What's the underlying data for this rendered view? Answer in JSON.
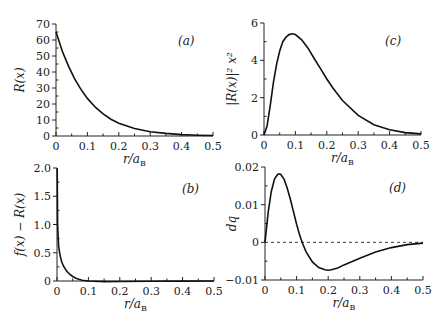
{
  "chart_data": [
    {
      "id": "a",
      "type": "line",
      "panel_label": "(a)",
      "xlabel": "r/a_B",
      "ylabel": "R(x)",
      "xlim": [
        0,
        0.5
      ],
      "ylim": [
        0,
        70
      ],
      "xticks": [
        0,
        0.1,
        0.2,
        0.3,
        0.4,
        0.5
      ],
      "xtick_labels": [
        "0",
        "0.1",
        "0.2",
        "0.3",
        "0.4",
        "0.5"
      ],
      "yticks": [
        0,
        10,
        20,
        30,
        40,
        50,
        60,
        70
      ],
      "ytick_labels": [
        "0",
        "10",
        "20",
        "30",
        "40",
        "50",
        "60",
        "70"
      ],
      "series": [
        {
          "name": "R(x)",
          "x": [
            0,
            0.02,
            0.04,
            0.06,
            0.08,
            0.1,
            0.125,
            0.15,
            0.175,
            0.2,
            0.25,
            0.3,
            0.35,
            0.4,
            0.45,
            0.5
          ],
          "y": [
            65,
            53,
            43.5,
            35.5,
            29,
            23.5,
            18,
            13.8,
            10.5,
            8,
            4.7,
            2.7,
            1.6,
            0.9,
            0.5,
            0.3
          ]
        }
      ]
    },
    {
      "id": "b",
      "type": "line",
      "panel_label": "(b)",
      "xlabel": "r/a_B",
      "ylabel": "f(x) − R(x)",
      "xlim": [
        0,
        0.5
      ],
      "ylim": [
        0,
        2.0
      ],
      "xticks": [
        0,
        0.1,
        0.2,
        0.3,
        0.4,
        0.5
      ],
      "xtick_labels": [
        "0",
        "0.1",
        "0.2",
        "0.3",
        "0.4",
        "0.5"
      ],
      "yticks": [
        0,
        0.5,
        1.0,
        1.5,
        2.0
      ],
      "ytick_labels": [
        "0",
        "0.5",
        "1.0",
        "1.5",
        "2.0"
      ],
      "series": [
        {
          "name": "f(x) − R(x)",
          "x": [
            0.0005,
            0.002,
            0.005,
            0.01,
            0.015,
            0.02,
            0.03,
            0.04,
            0.05,
            0.06,
            0.07,
            0.08,
            0.1,
            0.15,
            0.2,
            0.3,
            0.4,
            0.5
          ],
          "y": [
            2.0,
            1.0,
            0.62,
            0.45,
            0.34,
            0.27,
            0.18,
            0.12,
            0.08,
            0.05,
            0.03,
            0.015,
            0.0,
            -0.01,
            -0.008,
            -0.004,
            -0.002,
            0.0
          ]
        }
      ]
    },
    {
      "id": "c",
      "type": "line",
      "panel_label": "(c)",
      "xlabel": "r/a_B",
      "ylabel": "|R(x)|² x²",
      "xlim": [
        0,
        0.5
      ],
      "ylim": [
        0,
        6
      ],
      "xticks": [
        0,
        0.1,
        0.2,
        0.3,
        0.4,
        0.5
      ],
      "xtick_labels": [
        "0",
        "0.1",
        "0.2",
        "0.3",
        "0.4",
        "0.5"
      ],
      "yticks": [
        0,
        2,
        4,
        6
      ],
      "ytick_labels": [
        "0",
        "2",
        "4",
        "6"
      ],
      "series": [
        {
          "name": "|R(x)|² x²",
          "x": [
            0,
            0.01,
            0.02,
            0.03,
            0.04,
            0.05,
            0.06,
            0.07,
            0.08,
            0.09,
            0.1,
            0.12,
            0.14,
            0.16,
            0.18,
            0.2,
            0.22,
            0.25,
            0.3,
            0.35,
            0.4,
            0.45,
            0.5
          ],
          "y": [
            0,
            0.5,
            1.6,
            2.8,
            3.8,
            4.5,
            5.0,
            5.25,
            5.38,
            5.42,
            5.38,
            5.1,
            4.65,
            4.1,
            3.55,
            3.0,
            2.5,
            1.85,
            1.05,
            0.55,
            0.28,
            0.13,
            0.06
          ]
        }
      ]
    },
    {
      "id": "d",
      "type": "line",
      "panel_label": "(d)",
      "xlabel": "r/a_B",
      "ylabel": "dq",
      "xlim": [
        0,
        0.5
      ],
      "ylim": [
        -0.01,
        0.02
      ],
      "xticks": [
        0,
        0.1,
        0.2,
        0.3,
        0.4,
        0.5
      ],
      "xtick_labels": [
        "0",
        "0.1",
        "0.2",
        "0.3",
        "0.4",
        "0.5"
      ],
      "yticks": [
        -0.01,
        0,
        0.01,
        0.02
      ],
      "ytick_labels": [
        "−0.01",
        "0",
        "0.01",
        "0.02"
      ],
      "reference_line": {
        "y": 0,
        "style": "dashed"
      },
      "series": [
        {
          "name": "dq",
          "x": [
            0,
            0.01,
            0.02,
            0.03,
            0.04,
            0.045,
            0.05,
            0.06,
            0.07,
            0.08,
            0.09,
            0.1,
            0.11,
            0.12,
            0.13,
            0.15,
            0.17,
            0.19,
            0.2,
            0.21,
            0.23,
            0.25,
            0.3,
            0.35,
            0.4,
            0.45,
            0.5
          ],
          "y": [
            0,
            0.008,
            0.0135,
            0.0168,
            0.018,
            0.0182,
            0.018,
            0.0168,
            0.0145,
            0.0115,
            0.0082,
            0.0048,
            0.0018,
            -0.0005,
            -0.0025,
            -0.0052,
            -0.0067,
            -0.0073,
            -0.0074,
            -0.0073,
            -0.0068,
            -0.006,
            -0.0042,
            -0.0026,
            -0.0014,
            -0.0006,
            -0.0002
          ]
        }
      ]
    }
  ]
}
